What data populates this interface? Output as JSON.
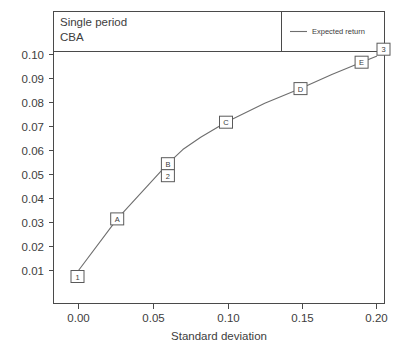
{
  "header": {
    "title_line1": "Single period",
    "title_line2": "CBA"
  },
  "legend": {
    "entries": [
      {
        "label": "Expected return",
        "color": "#6e6e6e",
        "icon": "line-sample-icon"
      }
    ]
  },
  "axes": {
    "x": {
      "title": "Standard deviation",
      "ticks": [
        "0.00",
        "0.05",
        "0.10",
        "0.15",
        "0.20"
      ],
      "tick_values": [
        0.0,
        0.05,
        0.1,
        0.15,
        0.2
      ],
      "range": [
        -0.0165,
        0.2175
      ]
    },
    "y": {
      "title": "",
      "ticks": [
        "0.01",
        "0.02",
        "0.03",
        "0.04",
        "0.05",
        "0.06",
        "0.07",
        "0.08",
        "0.09",
        "0.10"
      ],
      "tick_values": [
        0.01,
        0.02,
        0.03,
        0.04,
        0.05,
        0.06,
        0.07,
        0.08,
        0.09,
        0.1
      ],
      "range": [
        0.0028,
        0.1055
      ]
    }
  },
  "chart_data": {
    "type": "line",
    "title": "Single period CBA",
    "xlabel": "Standard deviation",
    "ylabel": "",
    "xlim": [
      -0.0165,
      0.2175
    ],
    "ylim": [
      0.0028,
      0.1055
    ],
    "grid": false,
    "legend_position": "top-right",
    "series": [
      {
        "name": "Expected return",
        "color": "#6e6e6e",
        "x": [
          0.0,
          0.026,
          0.06,
          0.07,
          0.082,
          0.099,
          0.125,
          0.149,
          0.17,
          0.19,
          0.2
        ],
        "y": [
          0.01,
          0.0315,
          0.0545,
          0.0604,
          0.0655,
          0.0718,
          0.0797,
          0.0858,
          0.0917,
          0.0968,
          0.0993
        ]
      }
    ],
    "point_markers": [
      {
        "label": "1",
        "x": 0.0,
        "y": 0.01,
        "offset": "below-left"
      },
      {
        "label": "A",
        "x": 0.026,
        "y": 0.0315,
        "offset": "center"
      },
      {
        "label": "B",
        "x": 0.06,
        "y": 0.0545,
        "offset": "center"
      },
      {
        "label": "2",
        "x": 0.06,
        "y": 0.0545,
        "offset": "below"
      },
      {
        "label": "C",
        "x": 0.099,
        "y": 0.0718,
        "offset": "center"
      },
      {
        "label": "D",
        "x": 0.149,
        "y": 0.0858,
        "offset": "center"
      },
      {
        "label": "E",
        "x": 0.19,
        "y": 0.0968,
        "offset": "center"
      },
      {
        "label": "3",
        "x": 0.2,
        "y": 0.0993,
        "offset": "above-right"
      }
    ]
  },
  "colors": {
    "line": "#6e6e6e",
    "frame": "#4a4a4a",
    "text": "#3d3d3d",
    "background": "#ffffff",
    "marker_fill": "#ffffff",
    "marker_stroke": "#5a5a5a"
  }
}
